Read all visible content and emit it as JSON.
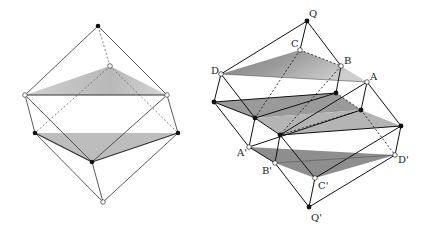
{
  "figure": {
    "left": {
      "name": "octahedron-slices",
      "vertices": {
        "top": [
          98,
          26
        ],
        "back": [
          110,
          66
        ],
        "left": [
          25,
          95
        ],
        "right": [
          167,
          95
        ],
        "left_low": [
          35,
          133
        ],
        "right_low": [
          178,
          133
        ],
        "front": [
          92,
          162
        ],
        "bottom": [
          103,
          202
        ]
      }
    },
    "right": {
      "name": "stacked-prism-slices",
      "labels": {
        "Q": "Q",
        "C": "C",
        "B": "B",
        "D": "D",
        "A": "A",
        "A_prime": "A'",
        "B_prime": "B'",
        "C_prime": "C'",
        "D_prime": "D'",
        "Q_prime": "Q'"
      }
    }
  },
  "colors": {
    "line": "#1a1a1a",
    "dashed": "#555555",
    "shade_dark": "#8f8f8f",
    "shade_light": "#c4c4c4",
    "fill_point": "#111111",
    "open_point": "#ffffff"
  }
}
